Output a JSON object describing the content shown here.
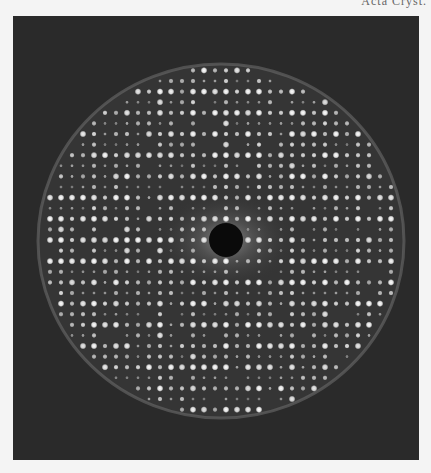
{
  "header": {
    "partial_caption": "Acta Cryst."
  },
  "figure": {
    "background_color": "#2a2a2a",
    "page_color": "#f4f4f4",
    "spot_color": "#ffffff",
    "beamstop_color": "#0a0a0a",
    "circle": {
      "cx": 208,
      "cy": 225,
      "rx": 183,
      "ry": 177
    },
    "beamstop": {
      "cx": 213,
      "cy": 224,
      "r": 17
    },
    "lattice": {
      "origin_x": 213,
      "origin_y": 224,
      "dx": 11,
      "dy": 10.6
    }
  }
}
